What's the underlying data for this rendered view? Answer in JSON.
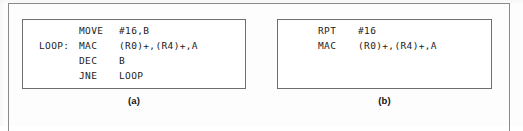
{
  "figure": {
    "panel_a": {
      "caption": "(a)",
      "lines": [
        {
          "label": "",
          "mnemonic": "MOVE",
          "operands": "#16,B"
        },
        {
          "label": "LOOP:",
          "mnemonic": "MAC",
          "operands": "(R0)+,(R4)+,A"
        },
        {
          "label": "",
          "mnemonic": "DEC",
          "operands": "B"
        },
        {
          "label": "",
          "mnemonic": "JNE",
          "operands": "LOOP"
        }
      ]
    },
    "panel_b": {
      "caption": "(b)",
      "lines": [
        {
          "label": "",
          "mnemonic": "RPT",
          "operands": "#16"
        },
        {
          "label": "",
          "mnemonic": "MAC",
          "operands": "(R0)+,(R4)+,A"
        }
      ]
    }
  },
  "colors": {
    "page_background": "#fdfdfd",
    "panel_background": "#ffffff",
    "panel_border": "#6e6e6e",
    "figure_border": "#8a8a8a",
    "code_text": "#1c1c1c",
    "caption_text": "#141414"
  }
}
